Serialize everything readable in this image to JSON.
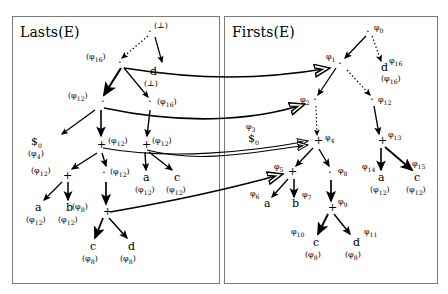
{
  "figure": {
    "panels": [
      {
        "id": "lasts",
        "title": "Lasts(E)"
      },
      {
        "id": "firsts",
        "title": "Firsts(E)"
      }
    ]
  },
  "left_panel": {
    "title": "Lasts(E)",
    "nodes": [
      {
        "name": "root-bottom",
        "sym": "⊥",
        "annot": "(⊥)",
        "x": 152,
        "y": 32
      },
      {
        "name": "node-phi16-dot",
        "sym": "·",
        "annot": "(φ₁₆)",
        "x": 118,
        "y": 63
      },
      {
        "name": "node-d",
        "sym": "d",
        "annot": "(⊥)",
        "x": 152,
        "y": 74
      },
      {
        "name": "node-phi12-dot",
        "sym": "·",
        "annot": "(φ₁₂)",
        "x": 99,
        "y": 102
      },
      {
        "name": "node-phi16-dot2",
        "sym": "·",
        "annot": "(φ₁₆)",
        "x": 152,
        "y": 102
      },
      {
        "name": "node-dollar0",
        "sym": "$₀",
        "annot": "(φ₄)",
        "x": 36,
        "y": 142
      },
      {
        "name": "node-plus-center",
        "sym": "+",
        "annot": "(φ₁₂)",
        "x": 99,
        "y": 145
      },
      {
        "name": "node-plus-right",
        "sym": "+",
        "annot": "(φ₁₂)",
        "x": 143,
        "y": 145
      },
      {
        "name": "node-plus-left2",
        "sym": "+",
        "annot": "(φ₁₂)",
        "x": 62,
        "y": 175
      },
      {
        "name": "node-dot-mid",
        "sym": "·",
        "annot": "(φ₁₂)",
        "x": 104,
        "y": 175
      },
      {
        "name": "leaf-a-right",
        "sym": "a",
        "annot": "(φ₁₂)",
        "x": 143,
        "y": 178
      },
      {
        "name": "leaf-c-right",
        "sym": "c",
        "annot": "(φ₁₂)",
        "x": 175,
        "y": 178
      },
      {
        "name": "leaf-a-left",
        "sym": "a",
        "annot": "(φ₁₂)",
        "x": 34,
        "y": 208
      },
      {
        "name": "leaf-b-left",
        "sym": "b",
        "annot": "(φ₁₂)",
        "x": 66,
        "y": 208
      },
      {
        "name": "node-plus-bottom",
        "sym": "+",
        "annot": "(φ₈)",
        "x": 104,
        "y": 212
      },
      {
        "name": "leaf-c-bottom",
        "sym": "c",
        "annot": "(φ₈)",
        "x": 89,
        "y": 247
      },
      {
        "name": "leaf-d-bottom",
        "sym": "d",
        "annot": "(φ₈)",
        "x": 128,
        "y": 247
      }
    ]
  },
  "right_panel": {
    "title": "Firsts(E)",
    "nodes": [
      {
        "name": "root-phi0",
        "sym": "·",
        "lbl": "φ₀",
        "x": 369,
        "y": 32
      },
      {
        "name": "node-phi1",
        "sym": "·",
        "lbl": "φ₁",
        "x": 338,
        "y": 63
      },
      {
        "name": "node-d",
        "sym": "d",
        "lbl": "φ₁₆",
        "annot": "(φ₁₆)",
        "x": 383,
        "y": 70
      },
      {
        "name": "node-phi2",
        "sym": "·",
        "lbl": "φ₂",
        "x": 313,
        "y": 100
      },
      {
        "name": "node-phi12",
        "sym": "·",
        "lbl": "φ₁₂",
        "x": 372,
        "y": 100
      },
      {
        "name": "node-phi3",
        "sym": "$₀",
        "lbl": "φ₃",
        "x": 252,
        "y": 134
      },
      {
        "name": "node-phi4",
        "sym": "+",
        "lbl": "φ₄",
        "x": 317,
        "y": 141
      },
      {
        "name": "node-phi13",
        "sym": "+",
        "lbl": "φ₁₃",
        "x": 381,
        "y": 141
      },
      {
        "name": "node-phi5",
        "sym": "+",
        "lbl": "φ₅",
        "x": 290,
        "y": 172
      },
      {
        "name": "node-phi8",
        "sym": "·",
        "lbl": "φ₈",
        "x": 330,
        "y": 172
      },
      {
        "name": "leaf-phi14-a",
        "sym": "a",
        "lbl": "φ₁₄",
        "annot": "(φ₁₂)",
        "x": 379,
        "y": 178
      },
      {
        "name": "leaf-phi15-c",
        "sym": "c",
        "lbl": "φ₁₅",
        "annot": "(φ₁₂)",
        "x": 416,
        "y": 178
      },
      {
        "name": "leaf-phi6-a",
        "sym": "a",
        "lbl": "φ₆",
        "x": 263,
        "y": 204
      },
      {
        "name": "leaf-phi7-b",
        "sym": "b",
        "lbl": "φ₇",
        "x": 294,
        "y": 204
      },
      {
        "name": "node-phi9",
        "sym": "+",
        "lbl": "φ₉",
        "x": 330,
        "y": 208
      },
      {
        "name": "leaf-phi10-c",
        "sym": "c",
        "lbl": "φ₁₀",
        "annot": "(φ₈)",
        "x": 312,
        "y": 243
      },
      {
        "name": "leaf-phi11-d",
        "sym": "d",
        "lbl": "φ₁₁",
        "annot": "(φ₈)",
        "x": 352,
        "y": 243
      }
    ]
  },
  "colors": {
    "stroke": "#000000",
    "panel_border": "#7a7a7a",
    "background": "#ffffff"
  }
}
